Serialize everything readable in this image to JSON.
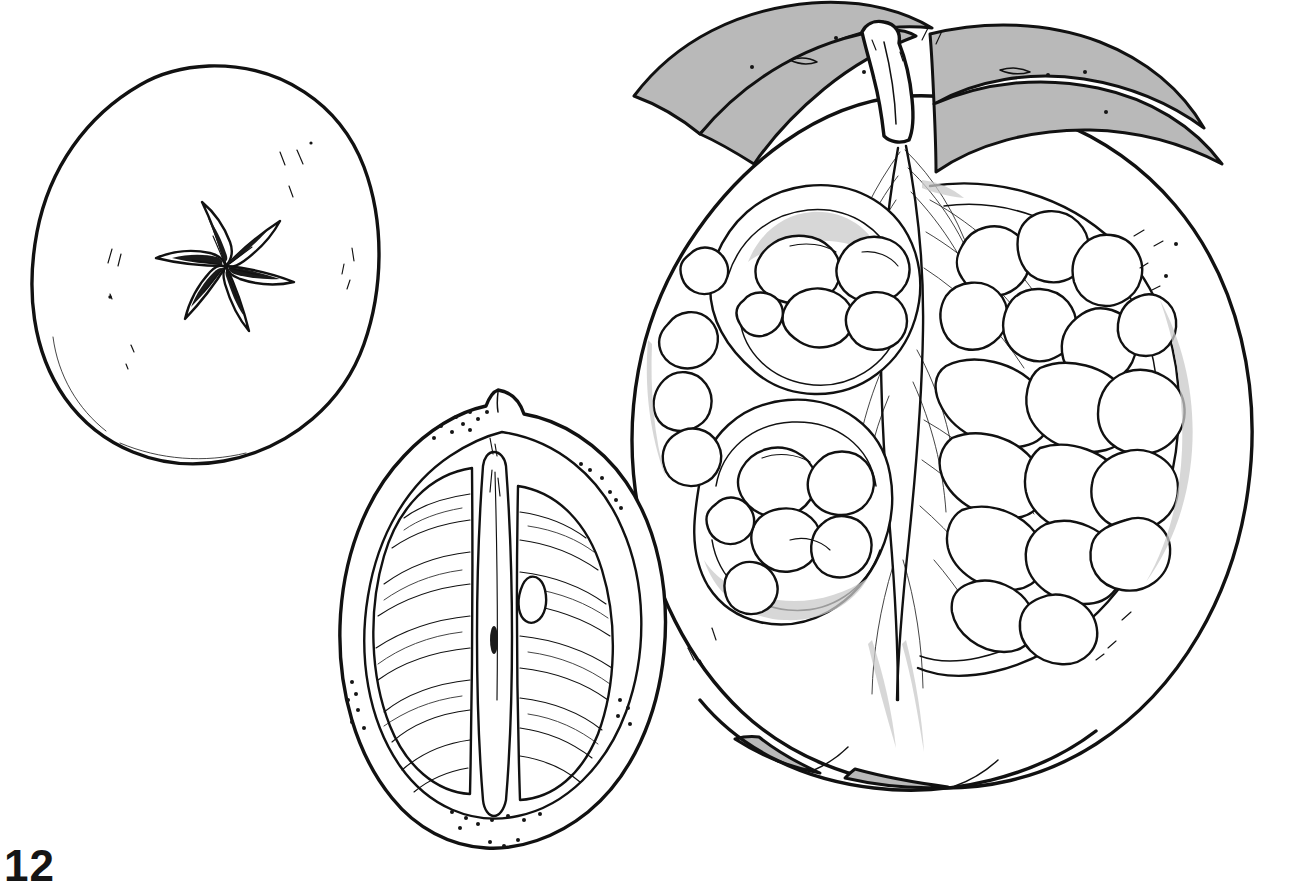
{
  "page": {
    "number": "12",
    "background_color": "#ffffff",
    "ink_color": "#111111",
    "shade_color": "#b9b9b9",
    "width": 1311,
    "height": 878,
    "medium": "pen-and-ink line drawing"
  },
  "figures": [
    {
      "id": "quince-top-view",
      "label": "Round fruit, calyx end view",
      "caption": "Whole round fruit seen from the calyx end with six-lobed star",
      "position": "top-left",
      "center": {
        "x": 209,
        "y": 266
      },
      "radius": {
        "x": 170,
        "y": 201
      },
      "parts": [
        {
          "name": "fruit-outline",
          "kind": "contour"
        },
        {
          "name": "calyx-star",
          "kind": "six-pointed-star",
          "points": 6
        },
        {
          "name": "skin-speckle-marks",
          "kind": "stipple"
        }
      ]
    },
    {
      "id": "lemon-longitudinal-section",
      "label": "Lemon cut lengthwise",
      "caption": "Citrus fruit halved lengthwise showing rind, two segment masses, central axis and one seed",
      "position": "bottom-center",
      "center": {
        "x": 500,
        "y": 632
      },
      "parts": [
        {
          "name": "rind-outline",
          "kind": "contour"
        },
        {
          "name": "albedo-inner-wall",
          "kind": "contour"
        },
        {
          "name": "segment-left",
          "kind": "locule"
        },
        {
          "name": "segment-right",
          "kind": "locule"
        },
        {
          "name": "central-column",
          "kind": "axis"
        },
        {
          "name": "juice-vesicle-lines",
          "kind": "hatching"
        },
        {
          "name": "seed",
          "kind": "seed",
          "count": 1
        },
        {
          "name": "oil-gland-dots",
          "kind": "stipple"
        },
        {
          "name": "nipple-tip",
          "kind": "apex"
        }
      ]
    },
    {
      "id": "pomegranate-section",
      "label": "Pomegranate cut open",
      "caption": "Large pomegranate sliced open showing crown of sepals, stem, central septum and chambers packed with arils",
      "position": "right",
      "center": {
        "x": 950,
        "y": 420
      },
      "parts": [
        {
          "name": "fruit-outline",
          "kind": "contour"
        },
        {
          "name": "crown-sepals",
          "kind": "calyx",
          "shaded": true,
          "shade_color": "#b9b9b9"
        },
        {
          "name": "stem",
          "kind": "peduncle"
        },
        {
          "name": "central-septum",
          "kind": "axis"
        },
        {
          "name": "membrane-walls",
          "kind": "carpel-wall"
        },
        {
          "name": "aril-cluster-upper-left",
          "kind": "aril-chamber"
        },
        {
          "name": "aril-cluster-lower-left",
          "kind": "aril-chamber"
        },
        {
          "name": "aril-cluster-right",
          "kind": "aril-chamber"
        },
        {
          "name": "pith-shading",
          "kind": "shading"
        },
        {
          "name": "lobed-base",
          "kind": "contour",
          "shaded": true
        }
      ]
    }
  ]
}
